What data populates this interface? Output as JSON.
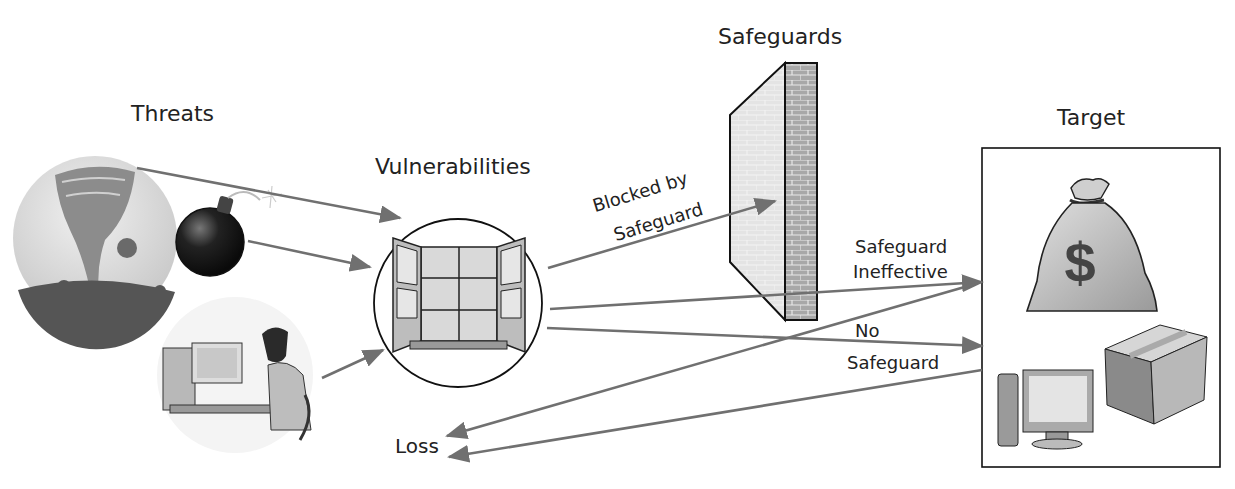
{
  "title_labels": {
    "threats": "Threats",
    "vulnerabilities": "Vulnerabilities",
    "safeguards": "Safeguards",
    "target": "Target",
    "loss": "Loss"
  },
  "edge_labels": {
    "blocked_line1": "Blocked by",
    "blocked_line2": "Safeguard",
    "ineffective_line1": "Safeguard",
    "ineffective_line2": "Ineffective",
    "none_line1": "No",
    "none_line2": "Safeguard"
  },
  "nodes": [
    {
      "id": "tornado",
      "group": "threats",
      "icon": "tornado-icon"
    },
    {
      "id": "bomb",
      "group": "threats",
      "icon": "bomb-icon"
    },
    {
      "id": "hacker",
      "group": "threats",
      "icon": "hacker-icon"
    },
    {
      "id": "window",
      "group": "vulnerabilities",
      "icon": "open-window-icon"
    },
    {
      "id": "wall",
      "group": "safeguards",
      "icon": "brick-wall-icon"
    },
    {
      "id": "money-bag",
      "group": "target",
      "icon": "money-bag-icon",
      "glyph": "$"
    },
    {
      "id": "computer",
      "group": "target",
      "icon": "computer-icon"
    },
    {
      "id": "box",
      "group": "target",
      "icon": "package-box-icon"
    }
  ],
  "edges": [
    {
      "from": "tornado",
      "to": "window"
    },
    {
      "from": "bomb",
      "to": "window"
    },
    {
      "from": "hacker",
      "to": "window"
    },
    {
      "from": "window",
      "to": "wall",
      "label": "Blocked by Safeguard"
    },
    {
      "from": "window",
      "to": "target",
      "label": "Safeguard Ineffective"
    },
    {
      "from": "window",
      "to": "target",
      "label": "No Safeguard"
    },
    {
      "from": "target",
      "to": "loss"
    },
    {
      "from": "target",
      "to": "loss"
    }
  ],
  "colors": {
    "arrow": "#707070",
    "outline": "#1a1a1a",
    "text": "#222222"
  }
}
